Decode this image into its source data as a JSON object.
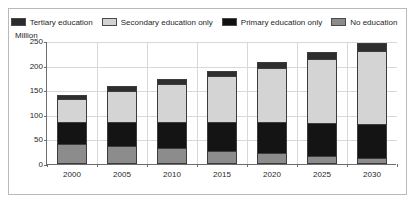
{
  "chart_data": {
    "type": "bar",
    "stacked": true,
    "title": "",
    "subtitle": "",
    "xlabel": "",
    "ylabel": "Million",
    "ylim": [
      0,
      250
    ],
    "yticks": [
      0,
      50,
      100,
      150,
      200,
      250
    ],
    "grid": true,
    "legend_position": "top",
    "categories": [
      "2000",
      "2005",
      "2010",
      "2015",
      "2020",
      "2025",
      "2030"
    ],
    "series": [
      {
        "name": "No education",
        "color": "#8c8c8c",
        "values": [
          37,
          33,
          28,
          23,
          18,
          13,
          8
        ]
      },
      {
        "name": "Primary education only",
        "color": "#141414",
        "values": [
          43,
          47,
          52,
          57,
          62,
          65,
          67
        ]
      },
      {
        "name": "Secondary education only",
        "color": "#d4d4d4",
        "values": [
          45,
          61,
          74,
          91,
          108,
          128,
          147
        ]
      },
      {
        "name": "Tertiary education",
        "color": "#2e2e2e",
        "values": [
          5,
          7,
          8,
          8,
          9,
          11,
          13
        ]
      }
    ],
    "totals": [
      130,
      148,
      162,
      179,
      197,
      217,
      235
    ]
  },
  "legend": {
    "items": [
      {
        "label": "Tertiary education",
        "swatch": "f-tert"
      },
      {
        "label": "Secondary education only",
        "swatch": "f-sec"
      },
      {
        "label": "Primary education only",
        "swatch": "f-prim"
      },
      {
        "label": "No education",
        "swatch": "f-none"
      }
    ]
  },
  "axis": {
    "y_unit_label": "Million"
  }
}
